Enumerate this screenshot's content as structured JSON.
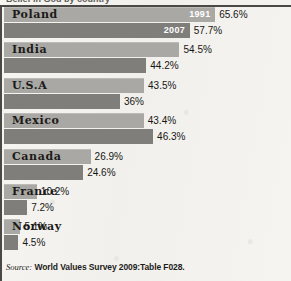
{
  "figure": {
    "title_cut": "Belief in God by country",
    "source_label": "Source:",
    "source_text": "World Values Survey 2009:Table F028."
  },
  "chart_data": {
    "type": "bar",
    "orientation": "horizontal",
    "title": "",
    "xlabel": "",
    "ylabel": "",
    "xlim": [
      0,
      100
    ],
    "grid": false,
    "legend_position": "inline-bar-labels",
    "categories": [
      "Poland",
      "India",
      "U.S.A",
      "Mexico",
      "Canada",
      "France",
      "Norway"
    ],
    "series": [
      {
        "name": "1991",
        "color": "#a9a8a4",
        "values": [
          65.6,
          54.5,
          43.5,
          43.4,
          26.9,
          10.2,
          5.1
        ],
        "labels": [
          "65.6%",
          "54.5%",
          "43.5%",
          "43.4%",
          "26.9%",
          "10.2%",
          "5.1%"
        ]
      },
      {
        "name": "2007",
        "color": "#7f7e7a",
        "values": [
          57.7,
          44.2,
          36.0,
          46.3,
          24.6,
          7.2,
          4.5
        ],
        "labels": [
          "57.7%",
          "44.2%",
          "36%",
          "46.3%",
          "24.6%",
          "7.2%",
          "4.5%"
        ]
      }
    ]
  }
}
